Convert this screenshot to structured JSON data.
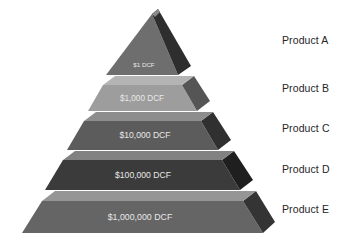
{
  "diagram": {
    "type": "pyramid",
    "title": "",
    "background_color": "#ffffff",
    "tiers": [
      {
        "id": "tier-a",
        "value_label": "$1 DCF",
        "product_label": "Product A",
        "face_color": "#6e6e6e",
        "side_color": "#2e2e2e",
        "bevel_color": "#8a8a8a",
        "text_color": "#e8e8e8",
        "value_font_size": 6.2,
        "level": 1
      },
      {
        "id": "tier-b",
        "value_label": "$1,000 DCF",
        "product_label": "Product B",
        "face_color": "#9d9d9d",
        "side_color": "#555555",
        "bevel_color": "#b4b4b4",
        "text_color": "#f2f2f2",
        "value_font_size": 8.2,
        "level": 2
      },
      {
        "id": "tier-c",
        "value_label": "$10,000 DCF",
        "product_label": "Product C",
        "face_color": "#5c5c5c",
        "side_color": "#303030",
        "bevel_color": "#8d8d8d",
        "text_color": "#eaeaea",
        "value_font_size": 8.6,
        "level": 3
      },
      {
        "id": "tier-d",
        "value_label": "$100,000 DCF",
        "product_label": "Product D",
        "face_color": "#3b3b3b",
        "side_color": "#1f1f1f",
        "bevel_color": "#828282",
        "text_color": "#ededed",
        "value_font_size": 8.6,
        "level": 4
      },
      {
        "id": "tier-e",
        "value_label": "$1,000,000 DCF",
        "product_label": "Product E",
        "face_color": "#656565",
        "side_color": "#343434",
        "bevel_color": "#959595",
        "text_color": "#f0f0f0",
        "value_font_size": 8.8,
        "level": 5
      }
    ]
  }
}
